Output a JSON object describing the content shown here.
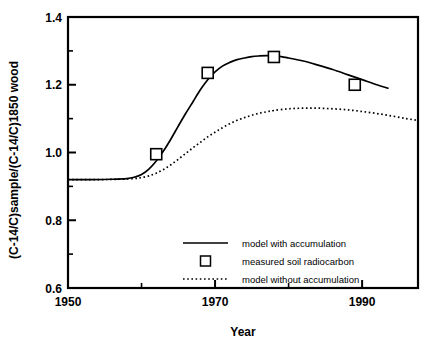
{
  "chart_data": {
    "type": "line",
    "title": "",
    "xlabel": "Year",
    "ylabel": "(C-14/C)sample/(C-14/C)1850 wood",
    "xlim": [
      1950,
      1997.6
    ],
    "ylim": [
      0.6,
      1.4
    ],
    "grid": false,
    "legend_position": "inside-lower-center",
    "x_ticks_major": [
      1950,
      1970,
      1990
    ],
    "x_ticks_major_labels": [
      "1950",
      "1970",
      "1990"
    ],
    "x_ticks_minor": [
      1960,
      1980
    ],
    "y_ticks_major": [
      0.6,
      0.8,
      1.0,
      1.2,
      1.4
    ],
    "y_ticks_major_labels": [
      "0.6",
      "0.8",
      "1.0",
      "1.2",
      "1.4"
    ],
    "y_ticks_minor": [
      0.7,
      0.9,
      1.1,
      1.3
    ],
    "series": [
      {
        "name": "model with accumulation",
        "style": "solid",
        "color": "#000000",
        "x": [
          1950,
          1953,
          1956,
          1958,
          1959,
          1960,
          1961,
          1962,
          1963,
          1964,
          1965,
          1966,
          1967,
          1968,
          1969,
          1970,
          1971,
          1972,
          1973,
          1974,
          1975,
          1976,
          1977,
          1978,
          1979,
          1980,
          1982,
          1984,
          1986,
          1988,
          1990,
          1992,
          1993.5
        ],
        "y": [
          0.92,
          0.92,
          0.921,
          0.923,
          0.927,
          0.935,
          0.951,
          0.975,
          1.005,
          1.04,
          1.078,
          1.115,
          1.15,
          1.185,
          1.215,
          1.238,
          1.255,
          1.266,
          1.274,
          1.279,
          1.283,
          1.285,
          1.286,
          1.285,
          1.283,
          1.279,
          1.27,
          1.258,
          1.245,
          1.23,
          1.215,
          1.2,
          1.19
        ]
      },
      {
        "name": "model without accumulation",
        "style": "dotted",
        "color": "#000000",
        "x": [
          1950,
          1954,
          1957,
          1959,
          1960,
          1961,
          1962,
          1963,
          1964,
          1965,
          1966,
          1967,
          1968,
          1969,
          1970,
          1971,
          1972,
          1973,
          1974,
          1975,
          1976,
          1977,
          1978,
          1980,
          1982,
          1984,
          1986,
          1988,
          1990,
          1992,
          1994,
          1996,
          1997.6
        ],
        "y": [
          0.92,
          0.92,
          0.921,
          0.923,
          0.926,
          0.931,
          0.939,
          0.95,
          0.964,
          0.98,
          0.997,
          1.014,
          1.03,
          1.046,
          1.06,
          1.073,
          1.085,
          1.095,
          1.103,
          1.11,
          1.116,
          1.12,
          1.124,
          1.129,
          1.131,
          1.131,
          1.129,
          1.126,
          1.121,
          1.115,
          1.108,
          1.1,
          1.095
        ]
      },
      {
        "name": "measured soil radiocarbon",
        "style": "marker-open-square",
        "color": "#000000",
        "x": [
          1962,
          1969,
          1978,
          1989
        ],
        "y": [
          0.995,
          1.235,
          1.282,
          1.2
        ]
      }
    ],
    "legend_entries": [
      {
        "label": "model with accumulation",
        "style": "solid"
      },
      {
        "label": "measured soil radiocarbon",
        "style": "marker-open-square"
      },
      {
        "label": "model without accumulation",
        "style": "dotted"
      }
    ]
  }
}
